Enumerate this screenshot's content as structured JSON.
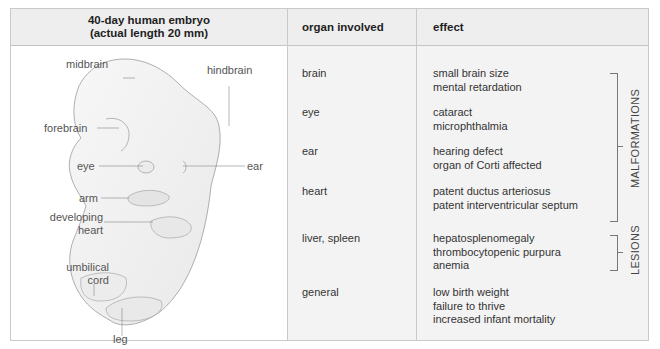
{
  "header": {
    "col1_line1": "40-day human embryo",
    "col1_line2": "(actual length 20 mm)",
    "col2": "organ involved",
    "col3": "effect"
  },
  "illustration": {
    "labels": {
      "midbrain": "midbrain",
      "hindbrain": "hindbrain",
      "forebrain": "forebrain",
      "eye": "eye",
      "ear": "ear",
      "arm": "arm",
      "developing_heart_1": "developing",
      "developing_heart_2": "heart",
      "umbilical_cord_1": "umbilical",
      "umbilical_cord_2": "cord",
      "leg": "leg"
    }
  },
  "rows": [
    {
      "organ": "brain",
      "effects": [
        "small brain size",
        "mental retardation"
      ]
    },
    {
      "organ": "eye",
      "effects": [
        "cataract",
        "microphthalmia"
      ]
    },
    {
      "organ": "ear",
      "effects": [
        "hearing defect",
        "organ of Corti affected"
      ]
    },
    {
      "organ": "heart",
      "effects": [
        "patent ductus arteriosus",
        "patent interventricular septum"
      ]
    },
    {
      "organ": "liver, spleen",
      "effects": [
        "hepatosplenomegaly",
        "thrombocytopenic purpura",
        "anemia"
      ]
    },
    {
      "organ": "general",
      "effects": [
        "low birth weight",
        "failure to thrive",
        "increased infant mortality"
      ]
    }
  ],
  "groups": {
    "malformations": "MALFORMATIONS",
    "lesions": "LESIONS"
  }
}
